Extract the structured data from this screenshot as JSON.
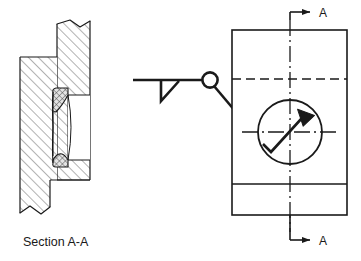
{
  "drawing": {
    "title": "Weld joint detail drawing",
    "caption": "Section A-A",
    "section_letter_top": "A",
    "section_letter_bottom": "A",
    "colors": {
      "line": "#1a1a1a",
      "hatch": "#4d4d4d",
      "weld_fill": "#d9d9d9",
      "background": "#ffffff"
    },
    "views": {
      "section": {
        "name": "Section A-A",
        "label": "Section A-A",
        "parts": [
          {
            "name": "vertical-plate",
            "hatch": "diagonal-up-right"
          },
          {
            "name": "horizontal-plate",
            "hatch": "diagonal-up-right"
          },
          {
            "name": "upper-weld-bead",
            "hatch": "cross-hatch"
          },
          {
            "name": "lower-weld-bead",
            "hatch": "cross-hatch"
          }
        ],
        "break_lines": [
          "top-break",
          "bottom-break"
        ]
      },
      "plan": {
        "name": "Plan view",
        "section_arrow_top_label": "A",
        "section_arrow_bottom_label": "A",
        "hidden_line": "dashed",
        "center_lines": [
          "vertical-centerline",
          "horizontal-centerline"
        ],
        "weld_circle": "weld-location-circle"
      }
    },
    "weld_symbol": {
      "name": "fillet-weld-symbol",
      "type": "fillet",
      "weld_all_around": true,
      "reference_line": "horizontal",
      "triangle_side": "below",
      "leader_arrow_target": "weld-location-circle"
    }
  }
}
